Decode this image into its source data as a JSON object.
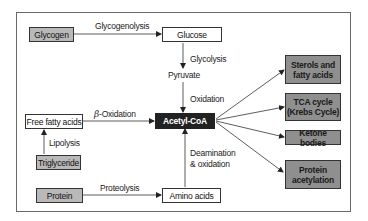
{
  "diagram": {
    "nodes": {
      "glycogen": "Glycogen",
      "glucose": "Glucose",
      "pyruvate": "Pyruvate",
      "acetyl_coa": "Acetyl-CoA",
      "free_fatty_acids": "Free fatty acids",
      "triglyceride": "Triglyceride",
      "protein": "Protein",
      "amino_acids": "Amino acids",
      "sterols_line1": "Sterols and",
      "sterols_line2": "fatty acids",
      "tca_line1": "TCA cycle",
      "tca_line2": "(Krebs Cycle)",
      "ketone_bodies": "Ketone bodies",
      "protein_acetylation_line1": "Protein",
      "protein_acetylation_line2": "acetylation"
    },
    "edge_labels": {
      "glycogenolysis": "Glycogenolysis",
      "glycolysis": "Glycolysis",
      "oxidation": "Oxidation",
      "beta_symbol": "β",
      "beta_oxidation": "-Oxidation",
      "lipolysis": "Lipolysis",
      "proteolysis": "Proteolysis",
      "deamination_line1": "Deamination",
      "deamination_line2": "& oxidation"
    },
    "colors": {
      "source_fill": "#b9b9b9",
      "product_fill": "#8f8f8f",
      "center_fill": "#222222",
      "line": "#333333"
    }
  }
}
